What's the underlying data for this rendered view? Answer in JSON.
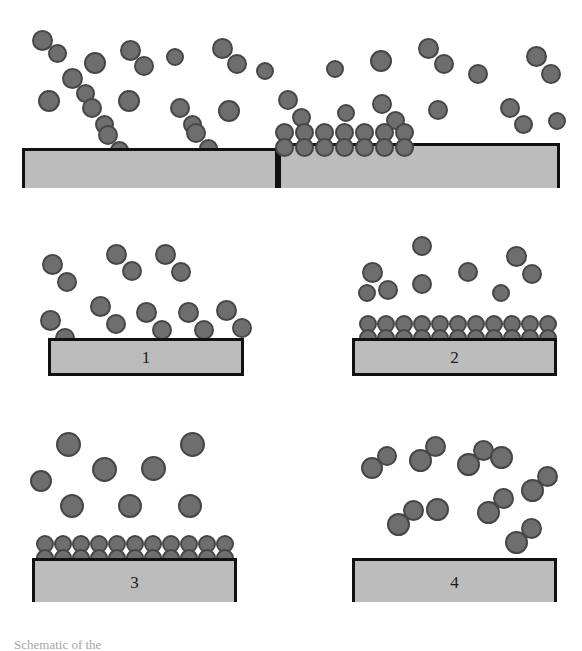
{
  "figure": {
    "background_color": "#ffffff",
    "caption_fragment": "Schematic of the"
  },
  "colors": {
    "atom_fill": "#6e6e6e",
    "atom_stroke": "#464646",
    "substrate_fill": "#bcbcbc",
    "substrate_stroke": "#111111",
    "label_color": "#1a1a1a"
  },
  "panels": [
    {
      "id": "panel-top",
      "name": "overview-panel",
      "label": "",
      "has_substrate": true,
      "substrate_stepped": true,
      "adsorbed_count": 7,
      "free_molecule_count": 17,
      "free_atom_count": 7,
      "description": "Overview: gas-phase diatomic molecules above a stepped substrate with a patch of adsorbed molecules in the recessed terrace"
    },
    {
      "id": "panel-1",
      "name": "stage-1-panel",
      "label": "1",
      "has_substrate": true,
      "substrate_stepped": false,
      "adsorbed_count": 0,
      "free_molecule_count": 8,
      "free_atom_count": 0,
      "description": "Stage 1: free diatomic molecules approach the clean bare substrate"
    },
    {
      "id": "panel-2",
      "name": "stage-2-panel",
      "label": "2",
      "has_substrate": true,
      "substrate_stepped": false,
      "adsorbed_count": 11,
      "free_molecule_count": 2,
      "free_atom_count": 5,
      "description": "Stage 2: a complete monolayer of molecules adsorbs onto the substrate surface"
    },
    {
      "id": "panel-3",
      "name": "stage-3-panel",
      "label": "3",
      "has_substrate": true,
      "substrate_stepped": false,
      "adsorbed_count": 11,
      "free_molecule_count": 0,
      "free_atom_count": 8,
      "description": "Stage 3: monolayer remains adsorbed while dissociated single atoms populate the gas phase"
    },
    {
      "id": "panel-4",
      "name": "stage-4-panel",
      "label": "4",
      "has_substrate": true,
      "substrate_stepped": false,
      "adsorbed_count": 0,
      "free_molecule_count": 8,
      "free_atom_count": 2,
      "description": "Stage 4: molecules recombine and desorb, leaving the substrate surface bare again"
    }
  ],
  "legend_semantics": {
    "molecule": "diatomic-molecule",
    "atom": "single-atom",
    "substrate": "solid-substrate"
  }
}
